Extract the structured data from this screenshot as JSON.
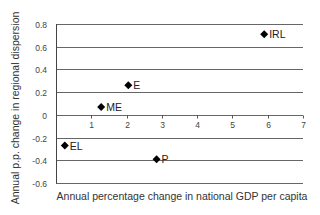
{
  "chart_data": {
    "type": "scatter",
    "title": "",
    "xlabel": "Annual percentage change in national GDP per capita",
    "ylabel": "Annual p.p. change in regional dispersion",
    "xlim": [
      0,
      7
    ],
    "ylim": [
      -0.6,
      0.8
    ],
    "xticks": [
      1,
      2,
      3,
      4,
      5,
      6,
      7
    ],
    "xtick_labels": [
      "1",
      "2",
      "3",
      "4",
      "5",
      "6",
      "7"
    ],
    "yticks": [
      0.8,
      0.6,
      0.4,
      0.2,
      0,
      -0.2,
      -0.4,
      -0.6
    ],
    "ytick_labels": [
      "0.8",
      "0.6",
      "0.4",
      "0.2",
      "0",
      "-0.2",
      "-0.4",
      "-0.6"
    ],
    "grid": "horizontal",
    "legend": null,
    "marker": "diamond",
    "marker_color": "#000000",
    "points": [
      {
        "label": "IRL",
        "x": 5.9,
        "y": 0.71
      },
      {
        "label": "E",
        "x": 2.05,
        "y": 0.26
      },
      {
        "label": "ME",
        "x": 1.28,
        "y": 0.07
      },
      {
        "label": "EL",
        "x": 0.25,
        "y": -0.27
      },
      {
        "label": "P",
        "x": 2.85,
        "y": -0.39
      }
    ]
  },
  "colors": {
    "gridline": "#555555",
    "axis": "#444444",
    "marker": "#000000"
  }
}
